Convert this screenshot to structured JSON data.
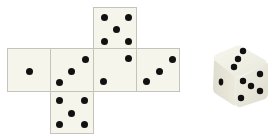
{
  "diagram": {
    "title": "",
    "net": {
      "faces": [
        {
          "id": "left",
          "pips": 1,
          "x": 7,
          "y": 48,
          "w": 44,
          "h": 44,
          "dots": [
            [
              29,
              71
            ]
          ]
        },
        {
          "id": "second",
          "pips": 3,
          "x": 50,
          "y": 48,
          "w": 44,
          "h": 44,
          "dots": [
            [
              85,
              59
            ],
            [
              71,
              71
            ],
            [
              59,
              82
            ]
          ]
        },
        {
          "id": "top",
          "pips": 5,
          "x": 93,
          "y": 7,
          "w": 44,
          "h": 42,
          "dots": [
            [
              104,
              17
            ],
            [
              128,
              17
            ],
            [
              116,
              29
            ],
            [
              104,
              41
            ],
            [
              128,
              41
            ]
          ]
        },
        {
          "id": "center",
          "pips": 2,
          "x": 93,
          "y": 48,
          "w": 44,
          "h": 44,
          "dots": [
            [
              128,
              58
            ],
            [
              103,
              81
            ]
          ]
        },
        {
          "id": "right",
          "pips": 3,
          "x": 136,
          "y": 48,
          "w": 44,
          "h": 44,
          "dots": [
            [
              172,
              59
            ],
            [
              159,
              71
            ],
            [
              146,
              81
            ]
          ]
        },
        {
          "id": "bottom",
          "pips": 5,
          "x": 50,
          "y": 91,
          "w": 44,
          "h": 43,
          "dots": [
            [
              59,
              100
            ],
            [
              84,
              100
            ],
            [
              71,
              113
            ],
            [
              59,
              124
            ],
            [
              84,
              124
            ]
          ]
        }
      ]
    },
    "cube": {
      "visible_faces": {
        "top": 3,
        "left": 1,
        "right": 5
      }
    },
    "colors": {
      "face_fill": "#f6f5ec",
      "border": "#c4c4bc",
      "pip": "#111111"
    }
  }
}
